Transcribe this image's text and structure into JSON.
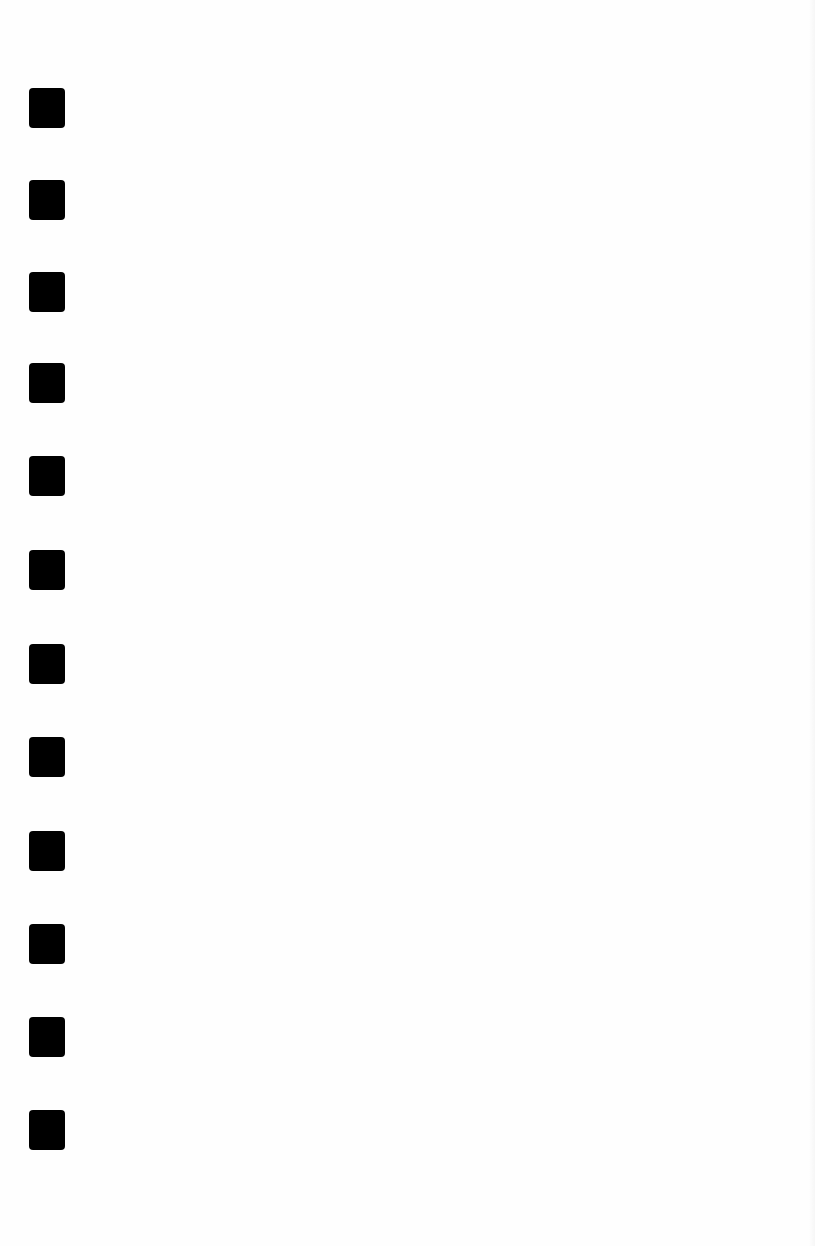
{
  "page": {
    "background": "#fefefe",
    "marker_color": "#000000",
    "markers": [
      {
        "top": 88
      },
      {
        "top": 180
      },
      {
        "top": 272
      },
      {
        "top": 363
      },
      {
        "top": 456
      },
      {
        "top": 550
      },
      {
        "top": 644
      },
      {
        "top": 737
      },
      {
        "top": 831
      },
      {
        "top": 924
      },
      {
        "top": 1017
      },
      {
        "top": 1110
      }
    ]
  }
}
